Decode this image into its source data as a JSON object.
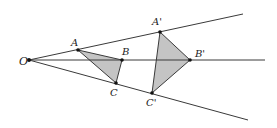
{
  "figure": {
    "colors": {
      "line": "#3a3a3a",
      "fill": "#c4c4c4",
      "point": "#111111",
      "background": "#ffffff"
    },
    "center": {
      "label": "O",
      "x": 29,
      "y": 60,
      "label_x": 19,
      "label_y": 65
    },
    "rays": [
      {
        "name": "ray-through-a",
        "x1": 29,
        "y1": 60,
        "x2": 243,
        "y2": 14
      },
      {
        "name": "ray-through-b",
        "x1": 29,
        "y1": 60,
        "x2": 265,
        "y2": 60
      },
      {
        "name": "ray-through-c",
        "x1": 29,
        "y1": 60,
        "x2": 248,
        "y2": 120
      }
    ],
    "original_triangle": {
      "points": [
        {
          "label": "A",
          "x": 78,
          "y": 50,
          "label_x": 71,
          "label_y": 46
        },
        {
          "label": "B",
          "x": 122,
          "y": 60,
          "label_x": 122,
          "label_y": 55
        },
        {
          "label": "C",
          "x": 116,
          "y": 83,
          "label_x": 110,
          "label_y": 96
        }
      ]
    },
    "image_triangle": {
      "points": [
        {
          "label": "A'",
          "x": 160,
          "y": 32,
          "label_x": 152,
          "label_y": 25
        },
        {
          "label": "B'",
          "x": 190,
          "y": 60,
          "label_x": 195,
          "label_y": 57
        },
        {
          "label": "C'",
          "x": 152,
          "y": 93,
          "label_x": 146,
          "label_y": 106
        }
      ]
    }
  }
}
